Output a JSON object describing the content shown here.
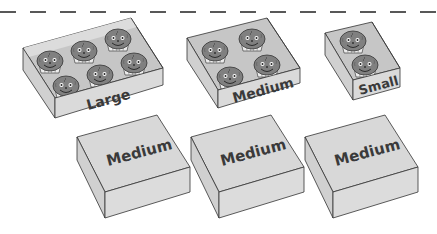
{
  "scene": {
    "description": "Boxes of muffins",
    "divider": {
      "style": "dashed",
      "color": "#222222"
    },
    "colors": {
      "box_face": "#d9d9d9",
      "box_side": "#cfcfcf",
      "box_inner": "#c4c4c4",
      "box_stroke": "#333333",
      "muffin_top": "#7f7f7f",
      "muffin_cup": "#e8e8e8",
      "label_text": "#3a3a3a"
    },
    "open_boxes": [
      {
        "size": "Large",
        "label": "Large",
        "muffin_count": 6
      },
      {
        "size": "Medium",
        "label": "Medium",
        "muffin_count": 4
      },
      {
        "size": "Small",
        "label": "Small",
        "muffin_count": 2
      }
    ],
    "closed_boxes": [
      {
        "label": "Medium"
      },
      {
        "label": "Medium"
      },
      {
        "label": "Medium"
      }
    ]
  }
}
